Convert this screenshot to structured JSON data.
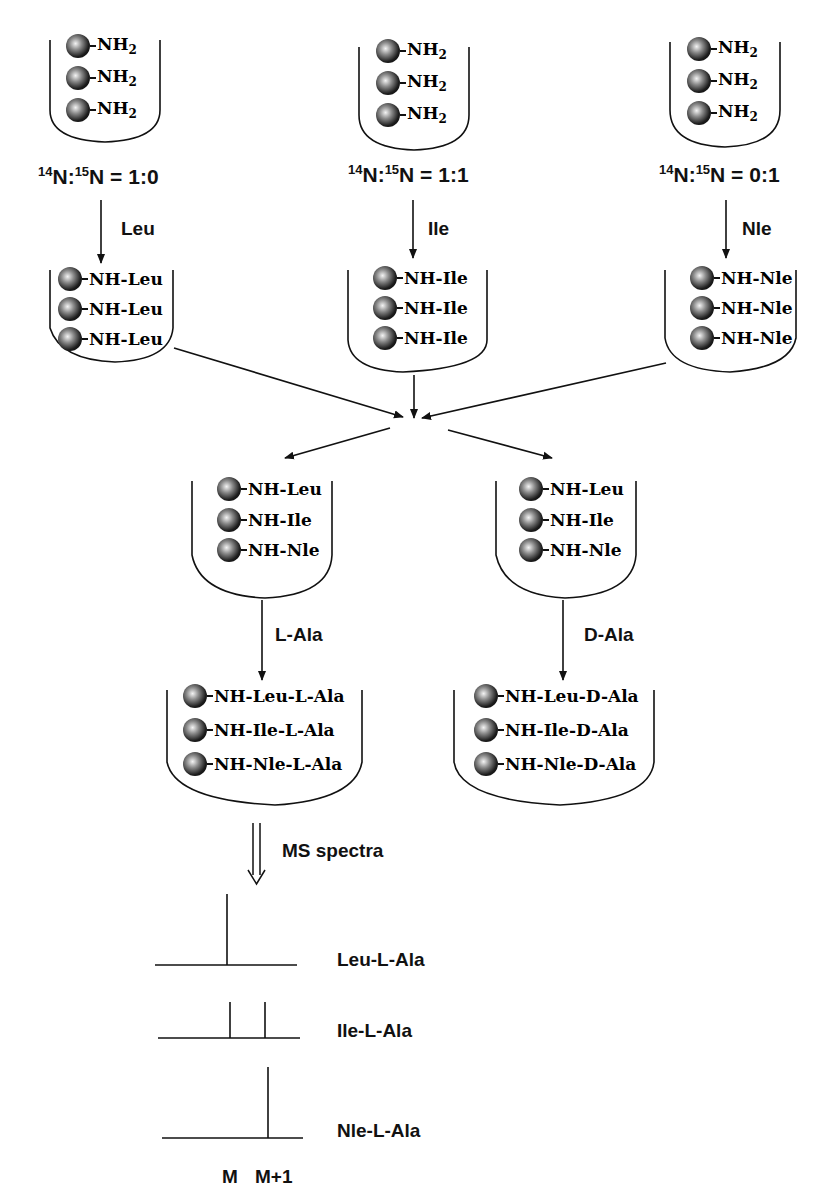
{
  "start_resins": [
    {
      "label": "NH2",
      "rows": [
        "NH",
        "NH",
        "NH"
      ],
      "ratio_prefix14": "14",
      "ratio_mid": "N:",
      "ratio_prefix15": "15",
      "ratio_tail": "N = 1:0",
      "reagent": "Leu"
    },
    {
      "label": "NH2",
      "rows": [
        "NH",
        "NH",
        "NH"
      ],
      "ratio_prefix14": "14",
      "ratio_mid": "N:",
      "ratio_prefix15": "15",
      "ratio_tail": "N = 1:1",
      "reagent": "Ile"
    },
    {
      "label": "NH2",
      "rows": [
        "NH",
        "NH",
        "NH"
      ],
      "ratio_prefix14": "14",
      "ratio_mid": "N:",
      "ratio_prefix15": "15",
      "ratio_tail": "N = 0:1",
      "reagent": "Nle"
    }
  ],
  "subscript": "2",
  "coupled_resins": [
    {
      "rows": [
        "NH-Leu",
        "NH-Leu",
        "NH-Leu"
      ]
    },
    {
      "rows": [
        "NH-Ile",
        "NH-Ile",
        "NH-Ile"
      ]
    },
    {
      "rows": [
        "NH-Nle",
        "NH-Nle",
        "NH-Nle"
      ]
    }
  ],
  "pooled_resins": [
    {
      "rows": [
        "NH-Leu",
        "NH-Ile",
        "NH-Nle"
      ],
      "reagent": "L-Ala"
    },
    {
      "rows": [
        "NH-Leu",
        "NH-Ile",
        "NH-Nle"
      ],
      "reagent": "D-Ala"
    }
  ],
  "dipeptide_resins": [
    {
      "rows": [
        "NH-Leu-L-Ala",
        "NH-Ile-L-Ala",
        "NH-Nle-L-Ala"
      ]
    },
    {
      "rows": [
        "NH-Leu-D-Ala",
        "NH-Ile-D-Ala",
        "NH-Nle-D-Ala"
      ]
    }
  ],
  "ms": {
    "arrow_label": "MS spectra",
    "spectra": [
      {
        "name": "Leu-L-Ala",
        "peaks": {
          "M": 1.0,
          "M+1": 0.0
        }
      },
      {
        "name": "Ile-L-Ala",
        "peaks": {
          "M": 0.5,
          "M+1": 0.5
        }
      },
      {
        "name": "Nle-L-Ala",
        "peaks": {
          "M": 0.0,
          "M+1": 1.0
        }
      }
    ],
    "axis_labels": [
      "M",
      "M+1"
    ]
  }
}
